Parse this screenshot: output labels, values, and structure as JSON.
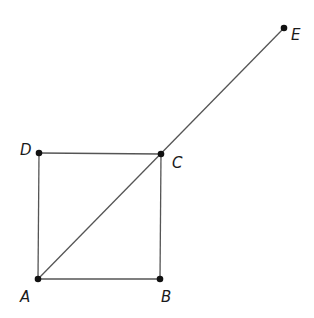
{
  "diagram": {
    "points": [
      {
        "id": "A",
        "label": "A",
        "x": 38,
        "y": 279,
        "lx": 20,
        "ly": 302
      },
      {
        "id": "B",
        "label": "B",
        "x": 160,
        "y": 279,
        "lx": 161,
        "ly": 302
      },
      {
        "id": "C",
        "label": "C",
        "x": 161,
        "y": 154,
        "lx": 172,
        "ly": 168
      },
      {
        "id": "D",
        "label": "D",
        "x": 39,
        "y": 153,
        "lx": 20,
        "ly": 155
      },
      {
        "id": "E",
        "label": "E",
        "x": 284,
        "y": 28,
        "lx": 291,
        "ly": 40
      }
    ],
    "segments": [
      [
        "A",
        "B"
      ],
      [
        "B",
        "C"
      ],
      [
        "C",
        "D"
      ],
      [
        "D",
        "A"
      ],
      [
        "A",
        "E"
      ]
    ],
    "colors": {
      "line": "#555555",
      "point": "#111111",
      "background": "#ffffff"
    }
  }
}
